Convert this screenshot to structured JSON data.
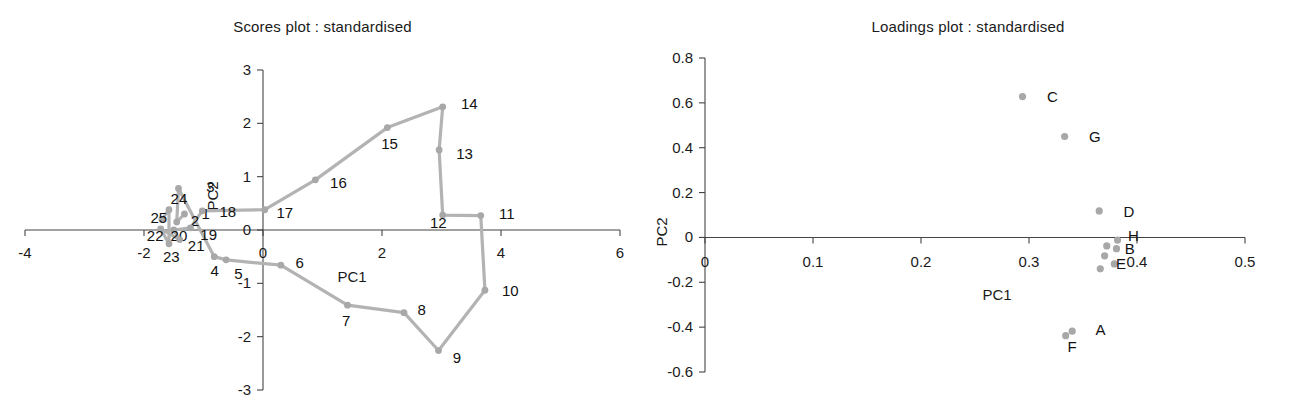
{
  "figure": {
    "panels": [
      "scores",
      "loadings"
    ]
  },
  "scores": {
    "title": "Scores plot : standardised",
    "xlabel": "PC1",
    "ylabel": "PC2"
  },
  "loadings": {
    "title": "Loadings plot : standardised",
    "xlabel": "PC1",
    "ylabel": "PC2"
  },
  "colors": {
    "marker": "#a8a8a8",
    "line": "#b3b3b3",
    "axis": "#444444",
    "text": "#1a1a1a"
  },
  "chart_data": [
    {
      "type": "scatter",
      "name": "scores",
      "title": "Scores plot : standardised",
      "xlabel": "PC1",
      "ylabel": "PC2",
      "xlim": [
        -4,
        6
      ],
      "ylim": [
        -3,
        3
      ],
      "xticks": [
        -4,
        -2,
        0,
        2,
        4,
        6
      ],
      "xticklabels": [
        "-4",
        "-2",
        "0",
        "2",
        "4",
        "6"
      ],
      "yticks": [
        -3,
        -2,
        -1,
        0,
        1,
        2,
        3
      ],
      "yticklabels": [
        "-3",
        "-2",
        "-1",
        "0",
        "1",
        "2",
        "3"
      ],
      "grid": false,
      "legend": false,
      "connected": true,
      "points": [
        {
          "label": "1",
          "x": -1.32,
          "y": 0.3,
          "lx": -1.1,
          "ly": 0.3
        },
        {
          "label": "2",
          "x": -1.45,
          "y": 0.15,
          "lx": -1.28,
          "ly": 0.16
        },
        {
          "label": "3",
          "x": -1.42,
          "y": 0.78,
          "lx": -1.02,
          "ly": 0.8
        },
        {
          "label": "4",
          "x": -0.82,
          "y": -0.5,
          "lx": -0.95,
          "ly": -0.76
        },
        {
          "label": "5",
          "x": -0.62,
          "y": -0.56,
          "lx": -0.55,
          "ly": -0.82
        },
        {
          "label": "6",
          "x": 0.3,
          "y": -0.66,
          "lx": 0.48,
          "ly": -0.62
        },
        {
          "label": "7",
          "x": 1.42,
          "y": -1.41,
          "lx": 1.26,
          "ly": -1.7
        },
        {
          "label": "8",
          "x": 2.37,
          "y": -1.55,
          "lx": 2.53,
          "ly": -1.5
        },
        {
          "label": "9",
          "x": 2.95,
          "y": -2.26,
          "lx": 3.12,
          "ly": -2.4
        },
        {
          "label": "10",
          "x": 3.73,
          "y": -1.13,
          "lx": 3.95,
          "ly": -1.14
        },
        {
          "label": "11",
          "x": 3.66,
          "y": 0.27,
          "lx": 3.9,
          "ly": 0.3
        },
        {
          "label": "12",
          "x": 3.02,
          "y": 0.28,
          "lx": 2.74,
          "ly": 0.14
        },
        {
          "label": "13",
          "x": 2.96,
          "y": 1.5,
          "lx": 3.18,
          "ly": 1.42
        },
        {
          "label": "14",
          "x": 3.02,
          "y": 2.31,
          "lx": 3.26,
          "ly": 2.36
        },
        {
          "label": "15",
          "x": 2.09,
          "y": 1.92,
          "lx": 1.92,
          "ly": 1.62
        },
        {
          "label": "16",
          "x": 0.88,
          "y": 0.94,
          "lx": 1.06,
          "ly": 0.88
        },
        {
          "label": "17",
          "x": 0.03,
          "y": 0.38,
          "lx": 0.16,
          "ly": 0.32
        },
        {
          "label": "18",
          "x": -1.02,
          "y": 0.36,
          "lx": -0.8,
          "ly": 0.34
        },
        {
          "label": "19",
          "x": -1.22,
          "y": 0.04,
          "lx": -1.12,
          "ly": -0.1
        },
        {
          "label": "20",
          "x": -1.5,
          "y": 0.0,
          "lx": -1.62,
          "ly": -0.12
        },
        {
          "label": "21",
          "x": -1.4,
          "y": -0.18,
          "lx": -1.33,
          "ly": -0.3
        },
        {
          "label": "22",
          "x": -1.72,
          "y": 0.02,
          "lx": -2.02,
          "ly": -0.12
        },
        {
          "label": "23",
          "x": -1.58,
          "y": -0.26,
          "lx": -1.75,
          "ly": -0.5
        },
        {
          "label": "24",
          "x": -1.58,
          "y": 0.38,
          "lx": -1.62,
          "ly": 0.58
        },
        {
          "label": "25",
          "x": -1.7,
          "y": 0.2,
          "lx": -1.96,
          "ly": 0.22
        }
      ]
    },
    {
      "type": "scatter",
      "name": "loadings",
      "title": "Loadings plot : standardised",
      "xlabel": "PC1",
      "ylabel": "PC2",
      "xlim": [
        0,
        0.5
      ],
      "ylim": [
        -0.6,
        0.8
      ],
      "xticks": [
        0,
        0.1,
        0.2,
        0.3,
        0.4,
        0.5
      ],
      "xticklabels": [
        "0",
        "0.1",
        "0.2",
        "0.3",
        "0.4",
        "0.5"
      ],
      "yticks": [
        -0.6,
        -0.4,
        -0.2,
        0,
        0.2,
        0.4,
        0.6,
        0.8
      ],
      "yticklabels": [
        "-0.6",
        "-0.4",
        "-0.2",
        "0",
        "0.2",
        "0.4",
        "0.6",
        "0.8"
      ],
      "grid": false,
      "legend": false,
      "connected": false,
      "points": [
        {
          "label": "C",
          "x": 0.294,
          "y": 0.628,
          "lx": 0.311,
          "ly": 0.628
        },
        {
          "label": "G",
          "x": 0.333,
          "y": 0.45,
          "lx": 0.35,
          "ly": 0.45
        },
        {
          "label": "D",
          "x": 0.365,
          "y": 0.118,
          "lx": 0.382,
          "ly": 0.112
        },
        {
          "label": "H",
          "x": 0.382,
          "y": -0.012,
          "lx": 0.386,
          "ly": 0.006
        },
        {
          "label": "B",
          "x": 0.381,
          "y": -0.05,
          "lx": 0.383,
          "ly": -0.05
        },
        {
          "label": "E",
          "x": 0.379,
          "y": -0.118,
          "lx": 0.375,
          "ly": -0.12
        },
        {
          "label": "A",
          "x": 0.34,
          "y": -0.418,
          "lx": 0.356,
          "ly": -0.412
        },
        {
          "label": "F",
          "x": 0.334,
          "y": -0.438,
          "lx": 0.33,
          "ly": -0.487
        }
      ],
      "extra_markers": [
        {
          "x": 0.372,
          "y": -0.038
        },
        {
          "x": 0.37,
          "y": -0.082
        },
        {
          "x": 0.366,
          "y": -0.14
        }
      ]
    }
  ]
}
